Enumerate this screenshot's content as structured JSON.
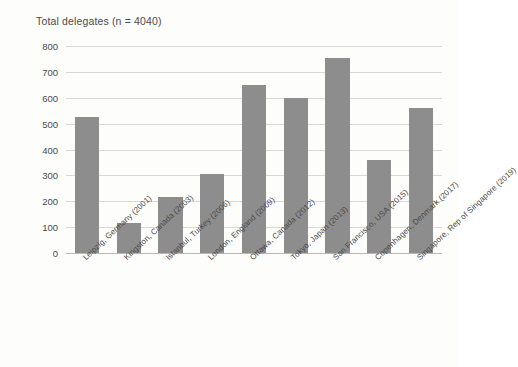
{
  "chart_data": {
    "type": "bar",
    "title": "Total delegates (n = 4040)",
    "xlabel": "",
    "ylabel": "",
    "ylim": [
      0,
      800
    ],
    "yticks": [
      0,
      100,
      200,
      300,
      400,
      500,
      600,
      700,
      800
    ],
    "ytick_labels": [
      "0",
      "100",
      "200",
      "300",
      "400",
      "500",
      "600",
      "700",
      "800"
    ],
    "grid": true,
    "legend": "none",
    "bar_color": "#8d8d8d",
    "categories": [
      "Leipzig, Germany (2001)",
      "Kingston, Canada (2003)",
      "Istanbul, Turkey (2006)",
      "London, England (2009)",
      "Ottawa, Canada (2012)",
      "Tokyo, Japan (2013)",
      "San Francisco, USA (2015)",
      "Copenhagen, Denmark (2017)",
      "Singapore, Rep of Singapore (2019)"
    ],
    "values": [
      525,
      115,
      215,
      305,
      650,
      600,
      755,
      360,
      560
    ]
  }
}
